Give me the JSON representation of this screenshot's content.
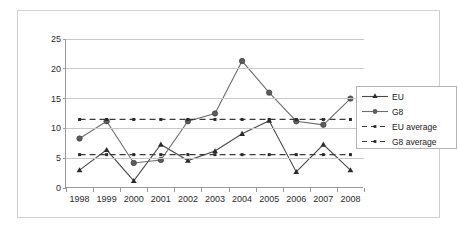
{
  "chart_data": {
    "type": "line",
    "title": "",
    "subtitle": "",
    "xlabel": "",
    "ylabel": "",
    "categories": [
      "1998",
      "1999",
      "2000",
      "2001",
      "2002",
      "2003",
      "2004",
      "2005",
      "2006",
      "2007",
      "2008"
    ],
    "series": [
      {
        "name": "EU",
        "marker": "triangle",
        "linestyle": "solid",
        "color": "#4a4a4a",
        "values": [
          3.0,
          6.4,
          1.2,
          7.3,
          4.6,
          6.2,
          9.1,
          11.3,
          2.7,
          7.3,
          3.0
        ]
      },
      {
        "name": "G8",
        "marker": "circle",
        "linestyle": "solid",
        "color": "#6e6e6e",
        "values": [
          8.3,
          11.2,
          4.2,
          4.7,
          11.2,
          12.5,
          21.3,
          16.0,
          11.2,
          10.6,
          15.0
        ]
      },
      {
        "name": "EU average",
        "marker": "dot",
        "linestyle": "dashed",
        "color": "#3a3a3a",
        "constant": 5.6,
        "values": [
          5.6,
          5.6,
          5.6,
          5.6,
          5.6,
          5.6,
          5.6,
          5.6,
          5.6,
          5.6,
          5.6
        ]
      },
      {
        "name": "G8 average",
        "marker": "dot",
        "linestyle": "dashed",
        "color": "#3a3a3a",
        "constant": 11.5,
        "values": [
          11.5,
          11.5,
          11.5,
          11.5,
          11.5,
          11.5,
          11.5,
          11.5,
          11.5,
          11.5,
          11.5
        ]
      }
    ],
    "yticks": [
      0,
      5,
      10,
      15,
      20,
      25
    ],
    "ytick_labels": [
      "0",
      "5",
      "10",
      "15",
      "20",
      "25"
    ],
    "ylim": [
      0,
      25
    ],
    "grid": true,
    "grid_axis": "y",
    "legend_position": "right",
    "legend_entries": [
      "EU",
      "G8",
      "EU average",
      "G8 average"
    ]
  },
  "legend": {
    "items": [
      {
        "label": "EU"
      },
      {
        "label": "G8"
      },
      {
        "label": "EU average"
      },
      {
        "label": "G8 average"
      }
    ]
  },
  "colors": {
    "background": "#ffffff",
    "frame": "#d0d0d0",
    "axis": "#9a9a9a",
    "gridline": "#c8c8c8",
    "eu": "#4a4a4a",
    "g8": "#6e6e6e",
    "average": "#3a3a3a",
    "text": "#2a2a2a"
  }
}
